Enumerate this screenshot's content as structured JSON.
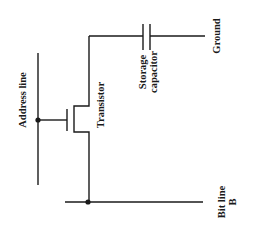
{
  "diagram": {
    "type": "DRAM cell schematic",
    "labels": {
      "address_line": "Address line",
      "transistor": "Transistor",
      "storage_capacitor_line1": "Storage",
      "storage_capacitor_line2": "capacitor",
      "ground": "Ground",
      "bit_line_line1": "Bit line",
      "bit_line_line2": "B"
    },
    "components": [
      "address line",
      "transistor",
      "storage capacitor",
      "ground",
      "bit line"
    ],
    "colors": {
      "line": "#1a1a1a",
      "background": "#ffffff"
    }
  }
}
